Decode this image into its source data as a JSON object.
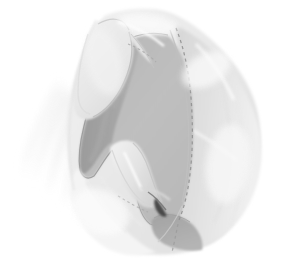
{
  "figure": {
    "alt_text": "Soft grayscale anatomical drawing of a joint cross-section with pale outer tissue, mid-gray interior cavity, darker gray upper-left shading, a dashed reference contour on the right, and a small dark wedge near the lower center.",
    "background_color": "#ffffff",
    "width_px": 283,
    "height_px": 278
  },
  "palette": {
    "background": "#ffffff",
    "wisp_faint": "#f4f4f4",
    "outer_pale": "#ececec",
    "outer_pale_2": "#e4e4e4",
    "body_light": "#dcdcdc",
    "body_mid": "#cfcfcf",
    "interior_mid": "#bdbdbd",
    "interior_mid_2": "#b4b4b4",
    "interior_dark": "#a0a0a0",
    "shadow_gray": "#949494",
    "wedge_gray": "#a8a8a8",
    "dark_accent": "#4a4a4a",
    "outline_soft": "#b0b0b0",
    "outline_mid": "#9a9a9a",
    "dashed_line": "#8e8e8e"
  },
  "regions": [
    {
      "id": "outer-tissue",
      "label": "Outer pale tissue mass",
      "fill": "#ececec",
      "notes": "Large irregular pale envelope occupying most of the frame."
    },
    {
      "id": "left-wisps",
      "label": "Left wispy striations",
      "fill": "#f4f4f4",
      "notes": "Feathered near-white streaks fanning to the lower left."
    },
    {
      "id": "upper-left-lobe",
      "label": "Upper-left rounded lobe",
      "fill": "#e8e8e8",
      "notes": "Teardrop lobe with soft outline at top left."
    },
    {
      "id": "interior-cavity",
      "label": "Central interior cavity",
      "fill": "#bdbdbd",
      "notes": "Large mid-gray region forming the central hollow."
    },
    {
      "id": "upper-left-shading",
      "label": "Upper-left cavity shading",
      "fill": "#a0a0a0",
      "notes": "Darker crescent shading along the left margin of the cavity."
    },
    {
      "id": "central-fin",
      "label": "Lower-center fin flap",
      "fill": "#e2e2e2",
      "notes": "Pale tapering flap rising from the lower center of the cavity."
    },
    {
      "id": "lower-wedge",
      "label": "Lower-center dark wedge",
      "fill": "#a8a8a8",
      "notes": "Triangular darker wedge at the bottom center-right."
    },
    {
      "id": "dark-notch",
      "label": "Dark notch mark",
      "fill": "#4a4a4a",
      "notes": "Small dark slanted accent near the lower center."
    },
    {
      "id": "right-flank",
      "label": "Right flank tissue",
      "fill": "#e0e0e0",
      "notes": "Broad pale right-hand mass with soft vertical creases."
    }
  ],
  "annotations": [
    {
      "id": "dashed-contour-right",
      "label": "Dashed reference contour (right)",
      "style": "dashed",
      "color": "#8e8e8e",
      "notes": "Long dashed line descending from the top center-right to the lower center."
    },
    {
      "id": "dashed-contour-upper",
      "label": "Dashed reference contour (upper)",
      "style": "dashed",
      "color": "#a2a2a2",
      "notes": "Short dashed arc across the upper-left lobe junction."
    },
    {
      "id": "contour-cavity",
      "label": "Cavity boundary outline",
      "style": "solid",
      "color": "#9a9a9a",
      "notes": "Soft continuous outline tracing the interior cavity margin."
    }
  ]
}
